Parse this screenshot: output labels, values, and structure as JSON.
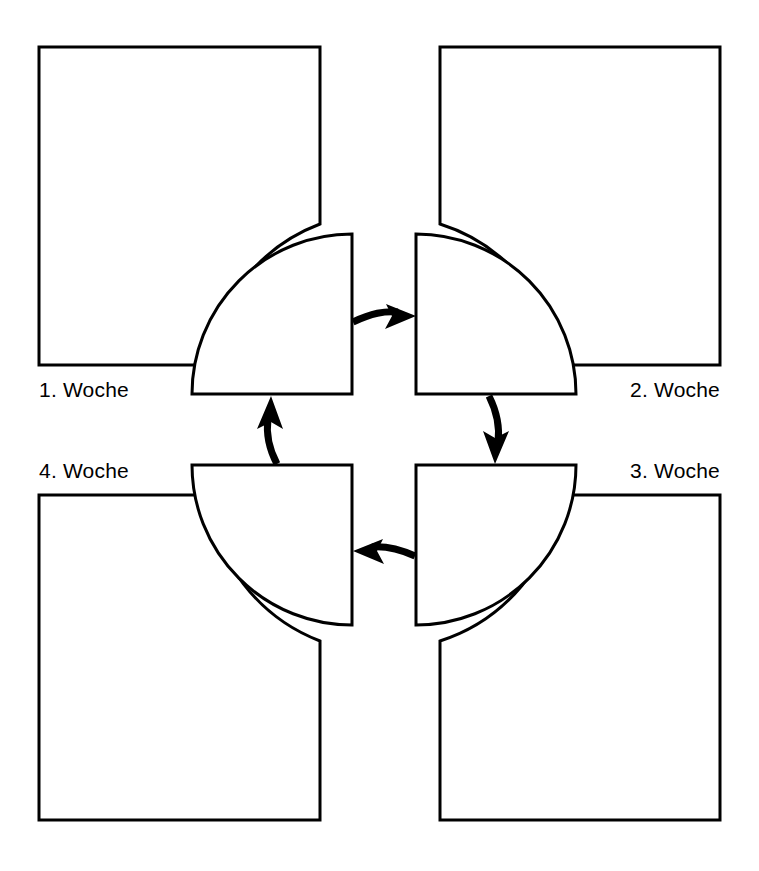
{
  "diagram": {
    "type": "cycle-diagram",
    "title": "",
    "colors": {
      "stroke": "#000000",
      "fill": "#ffffff",
      "background": "#ffffff",
      "text": "#000000"
    },
    "nodes": [
      {
        "id": "week1",
        "label": "1. Woche",
        "position": "top-left",
        "label_x": 39,
        "label_y": 397,
        "label_anchor": "start",
        "box": {
          "x": 39,
          "y": 47,
          "width": 281,
          "height": 318,
          "cut_corner": "bottom-right"
        }
      },
      {
        "id": "week2",
        "label": "2. Woche",
        "position": "top-right",
        "label_x": 720,
        "label_y": 397,
        "label_anchor": "end",
        "box": {
          "x": 440,
          "y": 47,
          "width": 280,
          "height": 318,
          "cut_corner": "bottom-left"
        }
      },
      {
        "id": "week3",
        "label": "3. Woche",
        "position": "bottom-right",
        "label_x": 720,
        "label_y": 478,
        "label_anchor": "end",
        "box": {
          "x": 440,
          "y": 495,
          "width": 280,
          "height": 325,
          "cut_corner": "top-left"
        }
      },
      {
        "id": "week4",
        "label": "4. Woche",
        "position": "bottom-left",
        "label_x": 39,
        "label_y": 478,
        "label_anchor": "start",
        "box": {
          "x": 39,
          "y": 495,
          "width": 281,
          "height": 325,
          "cut_corner": "top-right"
        }
      }
    ],
    "wedges": [
      {
        "id": "wedge-top-left",
        "quadrant": "top-left",
        "corner_x": 352,
        "corner_y": 394
      },
      {
        "id": "wedge-top-right",
        "quadrant": "top-right",
        "corner_x": 416,
        "corner_y": 394
      },
      {
        "id": "wedge-bottom-right",
        "quadrant": "bottom-right",
        "corner_x": 416,
        "corner_y": 465
      },
      {
        "id": "wedge-bottom-left",
        "quadrant": "bottom-left",
        "corner_x": 352,
        "corner_y": 465
      }
    ],
    "arrows": [
      {
        "id": "arrow-1-to-2",
        "from": "week1",
        "to": "week2",
        "direction": "right",
        "position": "top"
      },
      {
        "id": "arrow-2-to-3",
        "from": "week2",
        "to": "week3",
        "direction": "down",
        "position": "right"
      },
      {
        "id": "arrow-3-to-4",
        "from": "week3",
        "to": "week4",
        "direction": "left",
        "position": "bottom"
      },
      {
        "id": "arrow-4-to-1",
        "from": "week4",
        "to": "week1",
        "direction": "up",
        "position": "left"
      }
    ],
    "geometry": {
      "center_x": 384,
      "center_y": 430,
      "wedge_radius": 160,
      "box_cut_radius": 176
    }
  }
}
